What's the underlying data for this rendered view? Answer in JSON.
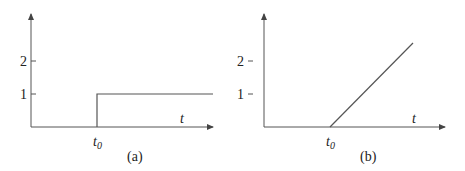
{
  "panels": [
    {
      "id": "a",
      "caption": "(a)",
      "x_axis_label": "t",
      "marker_label": "t",
      "marker_subscript": "0",
      "y_ticks": [
        "2",
        "1"
      ],
      "curve": "step"
    },
    {
      "id": "b",
      "caption": "(b)",
      "x_axis_label": "t",
      "marker_label": "t",
      "marker_subscript": "0",
      "y_ticks": [
        "2",
        "1"
      ],
      "curve": "ramp"
    }
  ],
  "colors": {
    "line": "#555555",
    "text": "#222222"
  }
}
